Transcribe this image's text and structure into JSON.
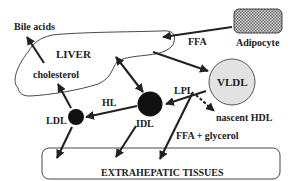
{
  "colors": {
    "ink": "#222222",
    "vldl_fill": "#e2e2e2",
    "particle_fill": "#111111",
    "adipocyte_fill": "#bdbdbd",
    "background": "#ffffff"
  },
  "nodes": {
    "adipocyte": {
      "label": "Adipocyte"
    },
    "liver": {
      "label": "LIVER"
    },
    "cholesterol": {
      "label": "cholesterol"
    },
    "bile_acids": {
      "label": "Bile acids"
    },
    "vldl": {
      "label": "VLDL"
    },
    "idl": {
      "label": "IDL"
    },
    "ldl": {
      "label": "LDL"
    },
    "nascent_hdl": {
      "label": "nascent HDL"
    },
    "extrahepatic": {
      "label": "EXTRAHEPATIC TISSUES"
    }
  },
  "edges": {
    "ffa": {
      "label": "FFA",
      "from": "Adipocyte",
      "to": "LIVER"
    },
    "liver_to_vldl": {
      "label": "",
      "from": "LIVER",
      "to": "VLDL"
    },
    "lpl": {
      "label": "LPL",
      "from": "VLDL",
      "to": "IDL"
    },
    "hl": {
      "label": "HL",
      "from": "IDL",
      "to": "LDL"
    },
    "idl_liver": {
      "label": "",
      "from": "IDL",
      "to": "LIVER",
      "bidirectional": true
    },
    "ldl_to_cholesterol": {
      "label": "",
      "from": "LDL",
      "to": "cholesterol"
    },
    "cholesterol_to_bile": {
      "label": "",
      "from": "cholesterol",
      "to": "Bile acids"
    },
    "vldl_to_hdl": {
      "label": "",
      "from": "VLDL",
      "to": "nascent HDL",
      "style": "dashed"
    },
    "ffa_glycerol": {
      "label": "FFA + glycerol",
      "from": "VLDL",
      "to": "EXTRAHEPATIC TISSUES"
    },
    "ldl_to_tissues": {
      "label": "",
      "from": "LDL",
      "to": "EXTRAHEPATIC TISSUES"
    },
    "idl_to_tissues": {
      "label": "",
      "from": "IDL",
      "to": "EXTRAHEPATIC TISSUES"
    }
  }
}
